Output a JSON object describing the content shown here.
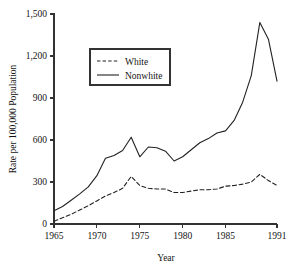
{
  "chart_data": {
    "type": "line",
    "title": "",
    "xlabel": "Year",
    "ylabel": "Rate per 100,000 Population",
    "xlim": [
      1965,
      1991
    ],
    "ylim": [
      0,
      1500
    ],
    "xticks": [
      1965,
      1970,
      1975,
      1980,
      1985,
      1991
    ],
    "xtick_labels": [
      "1965",
      "1970",
      "1975",
      "1980",
      "1985",
      "1991"
    ],
    "yticks": [
      0,
      300,
      600,
      900,
      1200,
      1500
    ],
    "ytick_labels": [
      "0",
      "300",
      "600",
      "900",
      "1,200",
      "1,500"
    ],
    "grid": false,
    "legend_position": "upper-left-inside",
    "x": [
      1965,
      1966,
      1967,
      1968,
      1969,
      1970,
      1971,
      1972,
      1973,
      1974,
      1975,
      1976,
      1977,
      1978,
      1979,
      1980,
      1981,
      1982,
      1983,
      1984,
      1985,
      1986,
      1987,
      1988,
      1989,
      1990,
      1991
    ],
    "series": [
      {
        "name": "White",
        "style": "dashed",
        "color": "#222222",
        "values": [
          20,
          45,
          70,
          100,
          130,
          165,
          200,
          225,
          255,
          340,
          275,
          255,
          250,
          250,
          225,
          225,
          235,
          245,
          245,
          250,
          270,
          275,
          285,
          300,
          355,
          310,
          275
        ]
      },
      {
        "name": "Nonwhite",
        "style": "solid",
        "color": "#222222",
        "values": [
          95,
          125,
          170,
          215,
          265,
          345,
          470,
          490,
          525,
          620,
          480,
          550,
          545,
          520,
          450,
          480,
          530,
          580,
          610,
          650,
          665,
          740,
          870,
          1060,
          1440,
          1320,
          1020
        ]
      }
    ]
  },
  "legend": {
    "entries": [
      {
        "label": "White",
        "style": "dashed"
      },
      {
        "label": "Nonwhite",
        "style": "solid"
      }
    ]
  }
}
